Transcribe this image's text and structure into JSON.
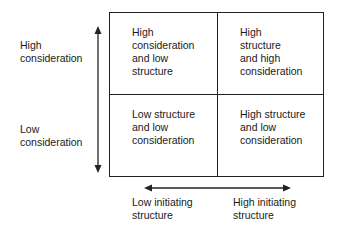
{
  "y_axis": {
    "high_label": "High\nconsideration",
    "low_label": "Low\nconsideration"
  },
  "x_axis": {
    "low_label": "Low initiating\nstructure",
    "high_label": "High initiating\nstructure"
  },
  "quadrants": {
    "top_left": "High\nconsideration\nand low\nstructure",
    "top_right": "High\nstructure\nand high\nconsideration",
    "bottom_left": "Low structure\nand low\nconsideration",
    "bottom_right": "High structure\nand low\nconsideration"
  },
  "colors": {
    "line": "#222222",
    "text": "#1a1a1a",
    "background": "#ffffff"
  }
}
